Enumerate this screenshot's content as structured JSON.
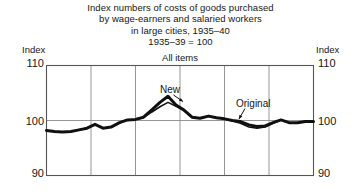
{
  "title": {
    "lines": [
      "Index numbers of costs of goods purchased",
      "by wage-earners and salaried workers",
      "in large cities, 1935–40",
      "1935–39 = 100"
    ]
  },
  "panel_caption": "All items",
  "axis": {
    "left_caption": "Index",
    "right_caption": "Index",
    "ticks": [
      "110",
      "100",
      "90"
    ]
  },
  "annotations": {
    "new": "New",
    "original": "Original"
  },
  "colors": {
    "background": "#ffffff",
    "axis": "#555555",
    "grid": "#8a8a8a",
    "series_new": "#101010",
    "series_original": "#101010",
    "text": "#161616"
  },
  "chart_data": {
    "type": "line",
    "title": "Index numbers of costs of goods purchased by wage-earners and salaried workers in large cities, 1935–40",
    "subtitle": "1935–39 = 100",
    "panel": "All items",
    "xlabel": "",
    "ylabel": "Index",
    "ylim": [
      90,
      110
    ],
    "yticks": [
      90,
      100,
      110
    ],
    "xlim": [
      1935,
      1941
    ],
    "grid": true,
    "gridlines_vertical": [
      1936,
      1937,
      1938,
      1939,
      1940
    ],
    "legend": "annotated",
    "annotations": [
      {
        "text": "New",
        "points_to_series": "New",
        "x": 1937.35,
        "y": 104.0
      },
      {
        "text": "Original",
        "points_to_series": "Original",
        "x": 1939.55,
        "y": 99.1
      }
    ],
    "series": [
      {
        "name": "New",
        "x": [
          1935.0,
          1935.18,
          1935.36,
          1935.55,
          1935.73,
          1935.91,
          1936.09,
          1936.27,
          1936.45,
          1936.64,
          1936.82,
          1937.0,
          1937.18,
          1937.36,
          1937.55,
          1937.73,
          1937.91,
          1938.09,
          1938.27,
          1938.45,
          1938.64,
          1938.82,
          1939.0,
          1939.18,
          1939.36,
          1939.55,
          1939.73,
          1939.91,
          1940.09,
          1940.27,
          1940.45,
          1940.64,
          1940.82,
          1941.0
        ],
        "y": [
          98.2,
          98.0,
          97.9,
          98.0,
          98.3,
          98.6,
          99.3,
          98.6,
          98.8,
          99.6,
          100.1,
          100.2,
          100.6,
          101.9,
          103.3,
          104.4,
          102.8,
          101.9,
          100.6,
          100.4,
          100.8,
          100.5,
          100.3,
          100.0,
          99.8,
          99.2,
          98.9,
          99.0,
          99.6,
          100.1,
          99.6,
          99.6,
          99.8,
          99.8
        ]
      },
      {
        "name": "Original",
        "x": [
          1935.0,
          1935.18,
          1935.36,
          1935.55,
          1935.73,
          1935.91,
          1936.09,
          1936.27,
          1936.45,
          1936.64,
          1936.82,
          1937.0,
          1937.18,
          1937.36,
          1937.55,
          1937.73,
          1937.91,
          1938.09,
          1938.27,
          1938.45,
          1938.64,
          1938.82,
          1939.0,
          1939.18,
          1939.36,
          1939.55,
          1939.73,
          1939.91,
          1940.09,
          1940.27,
          1940.45,
          1940.64,
          1940.82,
          1941.0
        ],
        "y": [
          98.2,
          98.0,
          97.9,
          98.0,
          98.3,
          98.6,
          99.3,
          98.6,
          98.8,
          99.6,
          100.1,
          100.2,
          100.5,
          101.5,
          102.5,
          103.3,
          102.6,
          101.8,
          100.6,
          100.4,
          100.8,
          100.5,
          100.3,
          99.9,
          99.5,
          98.8,
          98.6,
          98.8,
          99.5,
          100.1,
          99.6,
          99.6,
          99.8,
          99.8
        ]
      }
    ]
  }
}
